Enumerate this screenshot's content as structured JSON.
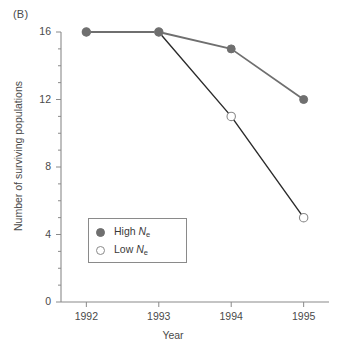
{
  "panel": {
    "label": "(B)"
  },
  "chart_data": {
    "type": "line",
    "title": "",
    "subtitle": "",
    "xlabel": "Year",
    "ylabel": "Number of surviving populations",
    "categories": [
      "1992",
      "1993",
      "1994",
      "1995"
    ],
    "x": [
      1992,
      1993,
      1994,
      1995
    ],
    "series": [
      {
        "name": "High Ne",
        "name_base": "High N",
        "name_sub": "e",
        "marker": "filled-circle",
        "color": "#6f6f6f",
        "values": [
          16,
          16,
          15,
          12
        ]
      },
      {
        "name": "Low Ne",
        "name_base": "Low N",
        "name_sub": "e",
        "marker": "open-circle",
        "color": "#ffffff",
        "values": [
          16,
          16,
          11,
          5
        ]
      }
    ],
    "xlim": [
      1991.65,
      1995.35
    ],
    "ylim": [
      0,
      16.6
    ],
    "ytick_labels": [
      "0",
      "4",
      "8",
      "12",
      "16"
    ],
    "ytick_values": [
      0,
      4,
      8,
      12,
      16
    ],
    "yminor_step": 1,
    "xtick_labels": [
      "1992",
      "1993",
      "1994",
      "1995"
    ],
    "grid": false,
    "legend_position": "inside-lower-left",
    "axis_color": "#8a8a8a",
    "line_color_high": "#6f6f6f",
    "line_color_low": "#2b2b2b"
  },
  "legend": {
    "items": [
      {
        "label_base": "High ",
        "label_var": "N",
        "label_sub": "e"
      },
      {
        "label_base": "Low ",
        "label_var": "N",
        "label_sub": "e"
      }
    ]
  }
}
